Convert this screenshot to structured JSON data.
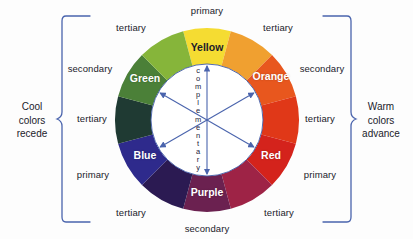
{
  "diagram": {
    "background_color": "#fdfdfd",
    "bracket_color": "#4a64ad",
    "axis_color": "#4a64ad",
    "center_label": "complementary",
    "left_caption": "Cool\ncolors\nrecede",
    "right_caption": "Warm\ncolors\nadvance",
    "left_caption_lines": [
      "Cool",
      "colors",
      "recede"
    ],
    "right_caption_lines": [
      "Warm",
      "colors",
      "advance"
    ]
  },
  "wheel": {
    "center_x": 207,
    "center_y": 120,
    "outer_radius": 92,
    "inner_radius": 56,
    "segment_count": 12,
    "segments": [
      {
        "name": "Yellow",
        "label": "Yellow",
        "color": "#f5dc32",
        "category": "primary",
        "show_label": true,
        "label_style": "dark",
        "angle_center": 90
      },
      {
        "name": "YellowOrange",
        "label": "",
        "color": "#f0a030",
        "category": "tertiary",
        "show_label": false,
        "label_style": "light",
        "angle_center": 60
      },
      {
        "name": "Orange",
        "label": "Orange",
        "color": "#e8571e",
        "category": "secondary",
        "show_label": true,
        "label_style": "light",
        "angle_center": 30
      },
      {
        "name": "RedOrange",
        "label": "",
        "color": "#e03818",
        "category": "tertiary",
        "show_label": false,
        "label_style": "light",
        "angle_center": 0
      },
      {
        "name": "Red",
        "label": "Red",
        "color": "#d4231c",
        "category": "primary",
        "show_label": true,
        "label_style": "light",
        "angle_center": -30
      },
      {
        "name": "RedPurple",
        "label": "",
        "color": "#9e2346",
        "category": "tertiary",
        "show_label": false,
        "label_style": "light",
        "angle_center": -60
      },
      {
        "name": "Purple",
        "label": "Purple",
        "color": "#6b2150",
        "category": "secondary",
        "show_label": true,
        "label_style": "light",
        "angle_center": -90
      },
      {
        "name": "BluePurple",
        "label": "",
        "color": "#2b1a52",
        "category": "tertiary",
        "show_label": false,
        "label_style": "light",
        "angle_center": -120
      },
      {
        "name": "Blue",
        "label": "Blue",
        "color": "#2e2a8c",
        "category": "primary",
        "show_label": true,
        "label_style": "light",
        "angle_center": -150
      },
      {
        "name": "BlueGreen",
        "label": "",
        "color": "#1f3a33",
        "category": "tertiary",
        "show_label": false,
        "label_style": "light",
        "angle_center": 180
      },
      {
        "name": "Green",
        "label": "Green",
        "color": "#4b8038",
        "category": "secondary",
        "show_label": true,
        "label_style": "light",
        "angle_center": 150
      },
      {
        "name": "YellowGreen",
        "label": "",
        "color": "#86b53a",
        "category": "tertiary",
        "show_label": false,
        "label_style": "light",
        "angle_center": 120
      }
    ]
  },
  "annotations": {
    "top": {
      "label": "primary",
      "x": 207,
      "y": 10
    },
    "bottom": {
      "label": "secondary",
      "x": 207,
      "y": 228
    },
    "top_left": {
      "label": "tertiary",
      "x": 131,
      "y": 27
    },
    "top_right": {
      "label": "tertiary",
      "x": 278,
      "y": 27
    },
    "mid_left_upper": {
      "label": "secondary",
      "x": 90,
      "y": 68
    },
    "mid_right_upper": {
      "label": "secondary",
      "x": 322,
      "y": 68
    },
    "mid_left_center": {
      "label": "tertiary",
      "x": 92,
      "y": 118
    },
    "mid_right_center": {
      "label": "tertiary",
      "x": 320,
      "y": 118
    },
    "mid_left_lower": {
      "label": "primary",
      "x": 93,
      "y": 174
    },
    "mid_right_lower": {
      "label": "primary",
      "x": 320,
      "y": 174
    },
    "bottom_left": {
      "label": "tertiary",
      "x": 131,
      "y": 212
    },
    "bottom_right": {
      "label": "tertiary",
      "x": 279,
      "y": 212
    }
  },
  "chart_data": {
    "type": "pie",
    "categories": [
      "Yellow",
      "Yellow-Orange",
      "Orange",
      "Red-Orange",
      "Red",
      "Red-Purple",
      "Purple",
      "Blue-Purple",
      "Blue",
      "Blue-Green",
      "Green",
      "Yellow-Green"
    ],
    "values": [
      1,
      1,
      1,
      1,
      1,
      1,
      1,
      1,
      1,
      1,
      1,
      1
    ],
    "colors": [
      "#f5dc32",
      "#f0a030",
      "#e8571e",
      "#e03818",
      "#d4231c",
      "#9e2346",
      "#6b2150",
      "#2b1a52",
      "#2e2a8c",
      "#1f3a33",
      "#4b8038",
      "#86b53a"
    ],
    "classifications": [
      "primary",
      "tertiary",
      "secondary",
      "tertiary",
      "primary",
      "tertiary",
      "secondary",
      "tertiary",
      "primary",
      "tertiary",
      "secondary",
      "tertiary"
    ],
    "legend": [
      "primary",
      "secondary",
      "tertiary"
    ],
    "annotations": [
      "Cool colors recede",
      "Warm colors advance",
      "complementary"
    ],
    "xlabel": "",
    "ylabel": ""
  }
}
